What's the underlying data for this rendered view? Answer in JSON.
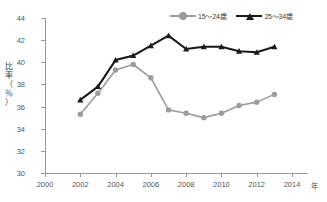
{
  "chart_data": {
    "type": "line",
    "title": "",
    "xlabel": "年",
    "ylabel": "比率（％）",
    "xlim": [
      2000,
      2014
    ],
    "ylim": [
      30,
      44
    ],
    "ytick_step": 2,
    "xtick_step": 2,
    "xticks": [
      "2000",
      "2002",
      "2004",
      "2006",
      "2008",
      "2010",
      "2012",
      "2014"
    ],
    "yticks": [
      "30",
      "32",
      "34",
      "36",
      "38",
      "40",
      "42",
      "44"
    ],
    "grid": false,
    "legend_position": "top-right",
    "x": [
      2002,
      2003,
      2004,
      2005,
      2006,
      2007,
      2008,
      2009,
      2010,
      2011,
      2012,
      2013
    ],
    "series": [
      {
        "name": "15～24歳",
        "color": "#9c9c9c",
        "marker": "circle",
        "values": [
          35.3,
          37.2,
          39.3,
          39.8,
          38.6,
          35.7,
          35.4,
          35.0,
          35.4,
          36.1,
          36.4,
          37.1
        ]
      },
      {
        "name": "25～34歳",
        "color": "#1a1a1a",
        "marker": "triangle",
        "values": [
          36.6,
          37.8,
          40.2,
          40.6,
          41.5,
          42.4,
          41.2,
          41.4,
          41.4,
          41.0,
          40.9,
          41.4
        ]
      }
    ]
  },
  "ylabel_chars": [
    "比",
    "率",
    "（",
    "％",
    "）"
  ],
  "caption": "",
  "colors": {
    "series1": "#9c9c9c",
    "series2": "#1a1a1a",
    "axis": "#9a9a9a",
    "tick_text": "#555555"
  }
}
